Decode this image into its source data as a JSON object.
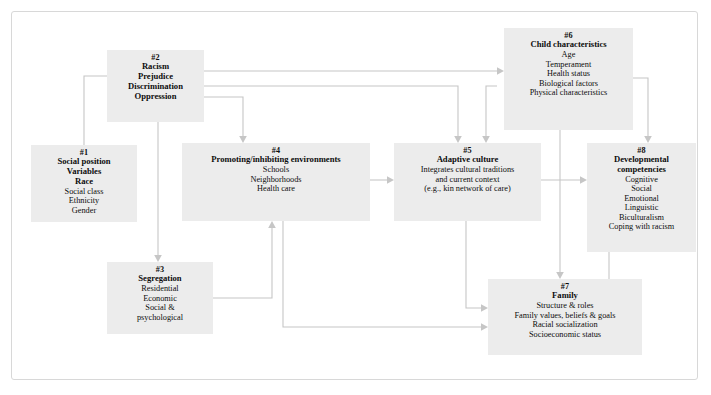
{
  "diagram": {
    "frame_border_color": "#d8d8d8",
    "node_fill_color": "#ececec",
    "connector_color": "#c6c6c6",
    "text_color": "#0c0c0c",
    "background_color": "#ffffff"
  },
  "nodes": [
    {
      "id": "node-1",
      "number": "#1",
      "title": "Social position",
      "title2": "Variables",
      "title3": "Race",
      "items": [
        "Social class",
        "Ethnicity",
        "Gender"
      ]
    },
    {
      "id": "node-2",
      "number": "#2",
      "title": "Racism",
      "items": [
        "Prejudice",
        "Discrimination",
        "Oppression"
      ],
      "items_bold": true
    },
    {
      "id": "node-3",
      "number": "#3",
      "title": "Segregation",
      "items": [
        "Residential",
        "Economic",
        "Social &",
        "psychological"
      ]
    },
    {
      "id": "node-4",
      "number": "#4",
      "title": "Promoting/inhibiting environments",
      "items": [
        "Schools",
        "Neighborhoods",
        "Health care"
      ]
    },
    {
      "id": "node-5",
      "number": "#5",
      "title": "Adaptive culture",
      "items": [
        "Integrates cultural traditions",
        "and current context",
        "(e.g., kin network of care)"
      ]
    },
    {
      "id": "node-6",
      "number": "#6",
      "title": "Child characteristics",
      "items": [
        "Age",
        "Temperament",
        "Health status",
        "Biological factors",
        "Physical characteristics"
      ]
    },
    {
      "id": "node-7",
      "number": "#7",
      "title": "Family",
      "items": [
        "Structure & roles",
        "Family values, beliefs & goals",
        "Racial socialization",
        "Socioeconomic status"
      ]
    },
    {
      "id": "node-8",
      "number": "#8",
      "title": "Developmental",
      "title2": "competencies",
      "items": [
        "Cognitive",
        "Social",
        "Emotional",
        "Linguistic",
        "Biculturalism",
        "Coping with racism"
      ]
    }
  ],
  "connections": [
    {
      "from": "#1",
      "to": "#2",
      "label": "social-position-to-racism"
    },
    {
      "from": "#2",
      "to": "#3",
      "label": "racism-to-segregation"
    },
    {
      "from": "#2",
      "to": "#4",
      "label": "racism-to-environments"
    },
    {
      "from": "#2",
      "to": "#5",
      "label": "racism-to-adaptive-culture"
    },
    {
      "from": "#2",
      "to": "#6",
      "label": "racism-to-child-characteristics"
    },
    {
      "from": "#3",
      "to": "#4",
      "label": "segregation-to-environments"
    },
    {
      "from": "#4",
      "to": "#5",
      "label": "environments-to-adaptive-culture"
    },
    {
      "from": "#4",
      "to": "#7",
      "label": "environments-to-family"
    },
    {
      "from": "#5",
      "to": "#7",
      "label": "adaptive-culture-to-family"
    },
    {
      "from": "#5",
      "to": "#8",
      "label": "adaptive-culture-to-competencies"
    },
    {
      "from": "#6",
      "to": "#5",
      "label": "child-characteristics-to-adaptive-culture"
    },
    {
      "from": "#6",
      "to": "#7",
      "label": "child-characteristics-to-family"
    },
    {
      "from": "#6",
      "to": "#8",
      "label": "child-characteristics-to-competencies"
    },
    {
      "from": "#7",
      "to": "#8",
      "label": "family-to-competencies"
    }
  ]
}
